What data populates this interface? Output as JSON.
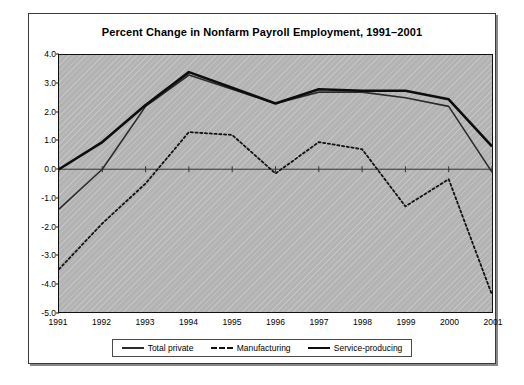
{
  "figure": {
    "title": "Percent Change in Nonfarm Payroll Employment, 1991–2001"
  },
  "chart_data": {
    "type": "line",
    "title": "Percent Change in Nonfarm Payroll Employment, 1991–2001",
    "xlabel": "",
    "ylabel": "",
    "x": [
      1991,
      1992,
      1993,
      1994,
      1995,
      1996,
      1997,
      1998,
      1999,
      2000,
      2001
    ],
    "categories": [
      "1991",
      "1992",
      "1993",
      "1994",
      "1995",
      "1996",
      "1997",
      "1998",
      "1999",
      "2000",
      "2001"
    ],
    "xlim": [
      1991,
      2001
    ],
    "ylim": [
      -5.0,
      4.0
    ],
    "yticks": [
      4.0,
      3.0,
      2.0,
      1.0,
      0.0,
      -1.0,
      -2.0,
      -3.0,
      -4.0,
      -5.0
    ],
    "ytick_labels": [
      "4.0",
      "3.0",
      "2.0",
      "1.0",
      "0.0",
      "-1.0",
      "-2.0",
      "-3.0",
      "-4.0",
      "-5.0"
    ],
    "grid": false,
    "zero_line": true,
    "legend_position": "bottom",
    "plot_background": "#b3b3b3",
    "series": [
      {
        "name": "Total private",
        "style": "solid-thin",
        "color": "#2b2b2b",
        "width": 1.6,
        "values": [
          -1.4,
          0.0,
          2.2,
          3.3,
          2.8,
          2.3,
          2.7,
          2.7,
          2.5,
          2.2,
          -0.1
        ]
      },
      {
        "name": "Manufacturing",
        "style": "dashed",
        "color": "#111111",
        "width": 1.8,
        "values": [
          -3.5,
          -1.9,
          -0.5,
          1.3,
          1.2,
          -0.15,
          0.95,
          0.7,
          -1.3,
          -0.35,
          -4.4
        ]
      },
      {
        "name": "Service-producing",
        "style": "solid-thick",
        "color": "#0d0d0d",
        "width": 2.6,
        "values": [
          0.0,
          0.95,
          2.25,
          3.4,
          2.85,
          2.3,
          2.8,
          2.75,
          2.75,
          2.45,
          0.8
        ]
      }
    ]
  },
  "legend": {
    "items": [
      {
        "label": "Total private",
        "swatch": "solid-thin-swatch"
      },
      {
        "label": "Manufacturing",
        "swatch": "dashed-swatch"
      },
      {
        "label": "Service-producing",
        "swatch": "solid-thick-swatch"
      }
    ]
  }
}
